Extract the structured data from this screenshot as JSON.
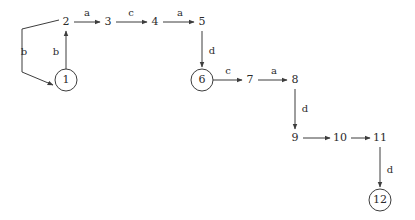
{
  "diagram": {
    "type": "state-transition-graph",
    "background_color": "#ffffff",
    "stroke_color": "#3d3d3d",
    "text_color": "#2b2b2b",
    "alphabet": [
      "a",
      "b",
      "c",
      "d"
    ],
    "nodes": [
      {
        "id": "1",
        "label": "1",
        "x": 66,
        "y": 80,
        "circled": true
      },
      {
        "id": "2",
        "label": "2",
        "x": 66,
        "y": 22,
        "circled": false
      },
      {
        "id": "3",
        "label": "3",
        "x": 108,
        "y": 22,
        "circled": false
      },
      {
        "id": "4",
        "label": "4",
        "x": 155,
        "y": 22,
        "circled": false
      },
      {
        "id": "5",
        "label": "5",
        "x": 202,
        "y": 22,
        "circled": false
      },
      {
        "id": "6",
        "label": "6",
        "x": 202,
        "y": 80,
        "circled": true
      },
      {
        "id": "7",
        "label": "7",
        "x": 250,
        "y": 80,
        "circled": false
      },
      {
        "id": "8",
        "label": "8",
        "x": 295,
        "y": 80,
        "circled": false
      },
      {
        "id": "9",
        "label": "9",
        "x": 295,
        "y": 138,
        "circled": false
      },
      {
        "id": "10",
        "label": "10",
        "x": 340,
        "y": 138,
        "circled": false
      },
      {
        "id": "11",
        "label": "11",
        "x": 380,
        "y": 138,
        "circled": false
      },
      {
        "id": "12",
        "label": "12",
        "x": 380,
        "y": 200,
        "circled": true
      }
    ],
    "edges": [
      {
        "id": "e-1-2",
        "from": "1",
        "to": "2",
        "label": "b",
        "label_x": 56,
        "label_y": 52
      },
      {
        "id": "e-2-1",
        "from": "2",
        "to": "1",
        "label": "b",
        "label_x": 24,
        "label_y": 52
      },
      {
        "id": "e-2-3",
        "from": "2",
        "to": "3",
        "label": "a",
        "label_x": 87,
        "label_y": 13
      },
      {
        "id": "e-3-4",
        "from": "3",
        "to": "4",
        "label": "c",
        "label_x": 131,
        "label_y": 13
      },
      {
        "id": "e-4-5",
        "from": "4",
        "to": "5",
        "label": "a",
        "label_x": 180,
        "label_y": 13
      },
      {
        "id": "e-5-6",
        "from": "5",
        "to": "6",
        "label": "d",
        "label_x": 212,
        "label_y": 51
      },
      {
        "id": "e-6-7",
        "from": "6",
        "to": "7",
        "label": "c",
        "label_x": 228,
        "label_y": 71
      },
      {
        "id": "e-7-8",
        "from": "7",
        "to": "8",
        "label": "a",
        "label_x": 274,
        "label_y": 71
      },
      {
        "id": "e-8-9",
        "from": "8",
        "to": "9",
        "label": "d",
        "label_x": 305,
        "label_y": 109
      },
      {
        "id": "e-9-10",
        "from": "9",
        "to": "10",
        "label": "",
        "label_x": 318,
        "label_y": 129
      },
      {
        "id": "e-10-11",
        "from": "10",
        "to": "11",
        "label": "",
        "label_x": 362,
        "label_y": 129
      },
      {
        "id": "e-11-12",
        "from": "11",
        "to": "12",
        "label": "d",
        "label_x": 390,
        "label_y": 170
      }
    ]
  }
}
